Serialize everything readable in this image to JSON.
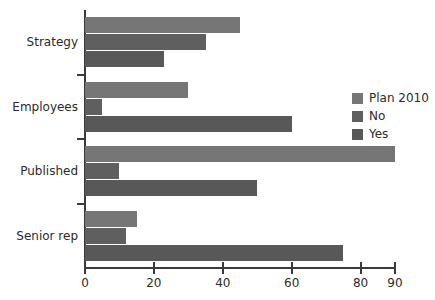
{
  "chart_data": {
    "type": "bar",
    "orientation": "horizontal",
    "title": "",
    "xlabel": "",
    "ylabel": "",
    "xlim": [
      0,
      90
    ],
    "grid": false,
    "legend_position": "right",
    "categories": [
      "Strategy",
      "Employees",
      "Published",
      "Senior rep"
    ],
    "xticks": [
      0,
      20,
      40,
      60,
      80,
      90
    ],
    "xtick_labels": [
      "0",
      "20",
      "40",
      "60",
      "80",
      "90"
    ],
    "series": [
      {
        "name": "Plan 2010",
        "color": "#767676",
        "values": [
          45,
          30,
          90,
          15
        ]
      },
      {
        "name": "No",
        "color": "#5f5f5f",
        "values": [
          35,
          5,
          10,
          12
        ]
      },
      {
        "name": "Yes",
        "color": "#585858",
        "values": [
          23,
          60,
          50,
          75
        ]
      }
    ]
  },
  "legend": {
    "items": [
      {
        "label": "Plan 2010"
      },
      {
        "label": "No"
      },
      {
        "label": "Yes"
      }
    ]
  },
  "axis": {
    "x_tick_labels": [
      "0",
      "20",
      "40",
      "60",
      "80",
      "90"
    ],
    "y_tick_labels": [
      "Strategy",
      "Employees",
      "Published",
      "Senior rep"
    ]
  }
}
